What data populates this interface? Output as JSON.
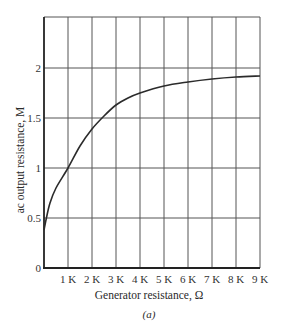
{
  "chart_data": {
    "type": "line",
    "title": "",
    "caption": "(a)",
    "xlabel": "Generator resistance, Ω",
    "ylabel": "ac output resistance, M",
    "xlim": [
      0,
      9000
    ],
    "ylim": [
      0,
      2.5
    ],
    "grid": true,
    "legend": null,
    "x_ticks": [
      1000,
      2000,
      3000,
      4000,
      5000,
      6000,
      7000,
      8000,
      9000
    ],
    "x_tick_labels": [
      "1 K",
      "2 K",
      "3 K",
      "4 K",
      "5 K",
      "6 K",
      "7 K",
      "8 K",
      "9 K"
    ],
    "y_ticks": [
      0,
      0.5,
      1,
      1.5,
      2
    ],
    "y_tick_labels": [
      "0",
      "0.5",
      "1",
      "1.5",
      "2"
    ],
    "series": [
      {
        "name": "ac output resistance",
        "x": [
          0,
          100,
          250,
          500,
          1000,
          1500,
          2000,
          2500,
          3000,
          3500,
          4000,
          5000,
          6000,
          7000,
          8000,
          9000
        ],
        "values": [
          0.38,
          0.5,
          0.65,
          0.8,
          1.0,
          1.22,
          1.39,
          1.52,
          1.63,
          1.7,
          1.75,
          1.82,
          1.86,
          1.89,
          1.91,
          1.92
        ]
      }
    ]
  },
  "layout": {
    "plot_left": 44,
    "plot_right": 260,
    "plot_top": 17,
    "plot_bottom": 268,
    "line_color": "#2b2b2b",
    "grid_color": "#555555"
  }
}
